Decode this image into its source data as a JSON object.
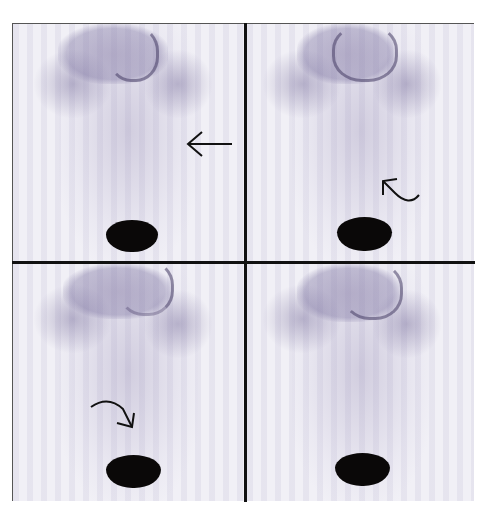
{
  "figure": {
    "type": "bone/scintigraphy-style anterior whole-body scans",
    "layout": "2x2 grid",
    "panels": [
      {
        "position": "top-left",
        "annotation": "straight-arrow-left",
        "arrow_direction": "left"
      },
      {
        "position": "top-right",
        "annotation": "curved-arrow-up-left",
        "arrow_direction": "up-left"
      },
      {
        "position": "bottom-left",
        "annotation": "curved-arrow-down-right",
        "arrow_direction": "down-right"
      },
      {
        "position": "bottom-right",
        "annotation": "none"
      }
    ],
    "colors": {
      "background": "#f1f0f6",
      "uptake_haze": "#968cb4",
      "bladder_hotspot": "#0a0808",
      "divider": "#111111"
    }
  }
}
